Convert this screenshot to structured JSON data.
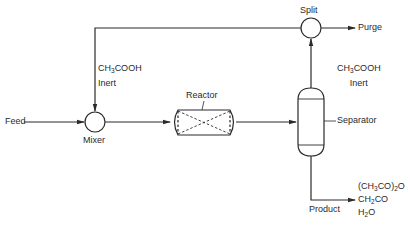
{
  "diagram": {
    "type": "process-flow",
    "units": {
      "mixer": {
        "label": "Mixer"
      },
      "reactor": {
        "label": "Reactor"
      },
      "separator": {
        "label": "Separator"
      },
      "split": {
        "label": "Split"
      }
    },
    "streams": {
      "feed": {
        "label": "Feed"
      },
      "purge": {
        "label": "Purge"
      },
      "product": {
        "label": "Product"
      },
      "recycle": {
        "components": [
          {
            "pre": "CH",
            "sub": "3",
            "post": "COOH"
          },
          {
            "pre": "Inert",
            "sub": "",
            "post": ""
          }
        ]
      },
      "separator_overhead": {
        "components": [
          {
            "pre": "CH",
            "sub": "3",
            "post": "COOH"
          },
          {
            "pre": "Inert",
            "sub": "",
            "post": ""
          }
        ]
      },
      "product_components": [
        {
          "pre": "(CH",
          "sub": "3",
          "post": "CO)",
          "sub2": "2",
          "post2": "O"
        },
        {
          "pre": "CH",
          "sub": "2",
          "post": "CO",
          "sub2": "",
          "post2": ""
        },
        {
          "pre": "H",
          "sub": "2",
          "post": "O",
          "sub2": "",
          "post2": ""
        }
      ]
    },
    "colors": {
      "line": "#2a2a2a",
      "background": "#ffffff"
    }
  }
}
